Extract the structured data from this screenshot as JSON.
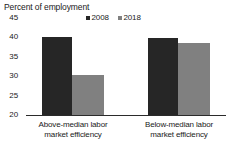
{
  "chart_data": {
    "type": "bar",
    "title": "Percent of employment",
    "xlabel": "",
    "ylabel": "",
    "ylim": [
      20,
      45
    ],
    "yticks": [
      "45",
      "40",
      "35",
      "30",
      "25",
      "20"
    ],
    "ytick_values": [
      45,
      40,
      35,
      30,
      25,
      20
    ],
    "grid": false,
    "legend_position": "top-center",
    "categories": [
      "Above-median labor market efficiency",
      "Below-median labor market efficiency"
    ],
    "category_lines": [
      [
        "Above-median labor",
        "market efficiency"
      ],
      [
        "Below-median labor",
        "market efficiency"
      ]
    ],
    "series": [
      {
        "name": "2008",
        "color": "#262626",
        "values": [
          40.0,
          39.8
        ]
      },
      {
        "name": "2018",
        "color": "#808080",
        "values": [
          30.3,
          38.6
        ]
      }
    ]
  },
  "legend": {
    "entries": [
      {
        "label": "2008",
        "color": "#262626",
        "marker": "square-marker"
      },
      {
        "label": "2018",
        "color": "#808080",
        "marker": "square-marker"
      }
    ]
  },
  "axis": {
    "baseline_color": "#2b2b2b"
  }
}
